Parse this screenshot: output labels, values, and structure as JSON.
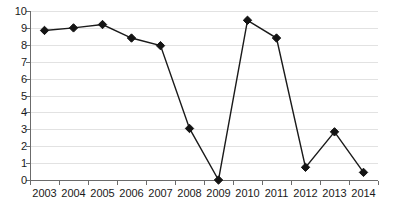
{
  "chart_data": {
    "type": "line",
    "title": "",
    "subtitle": "",
    "xlabel": "",
    "ylabel": "",
    "categories": [
      "2003",
      "2004",
      "2005",
      "2006",
      "2007",
      "2008",
      "2009",
      "2010",
      "2011",
      "2012",
      "2013",
      "2014"
    ],
    "values": [
      8.85,
      9.0,
      9.2,
      8.4,
      7.95,
      3.05,
      0.0,
      9.45,
      8.4,
      0.75,
      2.85,
      0.45
    ],
    "series": [
      {
        "name": "",
        "values": [
          8.85,
          9.0,
          9.2,
          8.4,
          7.95,
          3.05,
          0.0,
          9.45,
          8.4,
          0.75,
          2.85,
          0.45
        ]
      }
    ],
    "ylim": [
      0,
      10
    ],
    "yticks": [
      0,
      1,
      2,
      3,
      4,
      5,
      6,
      7,
      8,
      9,
      10
    ],
    "ytick_labels": [
      "0",
      "1",
      "2",
      "3",
      "4",
      "5",
      "6",
      "7",
      "8",
      "9",
      "10"
    ],
    "grid": true,
    "grid_axis": "y",
    "legend": false,
    "legend_position": "none",
    "marker": "diamond",
    "colors": {
      "line": "#1a1a1a",
      "marker": "#141414",
      "grid": "#e2e2e2",
      "axis": "#6b6b6b",
      "text": "#1a1a1a",
      "background": "#ffffff"
    }
  }
}
